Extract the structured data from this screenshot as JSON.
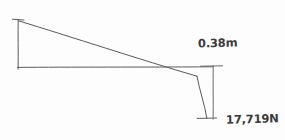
{
  "diagram": {
    "kind": "hand-drawn force / shear diagram sketch",
    "background_color": "#fdfdfd",
    "line_color": "#5a5a5a",
    "text_color": "#3b3b3b",
    "labels": {
      "depth": "0.38m",
      "force": "17,719N"
    },
    "geometry": {
      "baseline": {
        "x1": 18,
        "y1": 67,
        "x2": 213,
        "y2": 67
      },
      "left_vertical": {
        "x1": 18,
        "y1": 20,
        "x2": 18,
        "y2": 69
      },
      "left_top_tick": {
        "x1": 12,
        "y1": 19,
        "x2": 24,
        "y2": 20
      },
      "sloped_line": {
        "x1": 18,
        "y1": 21,
        "x2": 197,
        "y2": 76
      },
      "drop_line": {
        "x1": 197,
        "y1": 76,
        "x2": 207,
        "y2": 118
      },
      "bottom_tick": {
        "x1": 197,
        "y1": 118,
        "x2": 216,
        "y2": 118
      },
      "dimension_line": {
        "x1": 213,
        "y1": 66,
        "x2": 213,
        "y2": 119
      },
      "dimension_top_tick": {
        "x1": 200,
        "y1": 66,
        "x2": 222,
        "y2": 66
      }
    }
  }
}
